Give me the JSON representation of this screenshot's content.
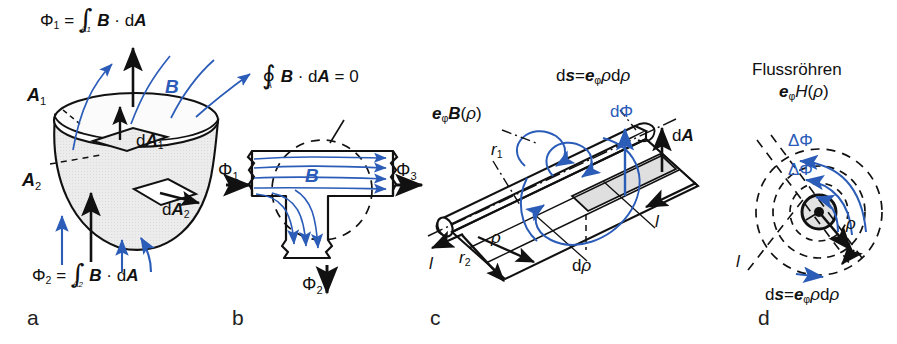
{
  "figure": {
    "background": "#ffffff",
    "ink_color": "#111111",
    "accent_blue": "#2b5cb8",
    "shade_gray": "#e8e8e8"
  },
  "panels": [
    {
      "id": "a",
      "letter": "a",
      "description": "Open bowl-shaped surface with surfaces A1 and A2 and flux arrows",
      "labels": {
        "flux1_formula": "Φ₁ = ∫ B · dA",
        "flux1_limit": "A₁",
        "flux2_formula": "Φ₂ = ∫ B · dA",
        "flux2_limit": "A₂",
        "surface_top": "A₁",
        "surface_bottom": "A₂",
        "element_top": "dA₁",
        "element_bottom": "dA₂",
        "field": "B"
      }
    },
    {
      "id": "b",
      "letter": "b",
      "description": "T-shaped magnetic circuit, closed surface integral equals zero",
      "labels": {
        "closed_integral": "∮ B · dA = 0",
        "closed_integral_limit": "A",
        "flux_in": "Φ₁",
        "flux_down": "Φ₂",
        "flux_out": "Φ₃",
        "field": "B"
      }
    },
    {
      "id": "c",
      "letter": "c",
      "description": "Cylindrical conductor with radial flux strip between r1 and r2",
      "labels": {
        "field_vector": "eφB(ρ)",
        "ds_vector": "ds=eφρdρ",
        "radius_inner": "r₁",
        "radius_outer": "r₂",
        "rho": "ρ",
        "drho": "dρ",
        "dphi": "dΦ",
        "dA": "dA",
        "length_left": "l",
        "length_right": "l"
      }
    },
    {
      "id": "d",
      "letter": "d",
      "description": "Cross section with concentric dashed flux tubes around a conductor",
      "labels": {
        "title": "Flussröhren",
        "field_vector": "eφH(ρ)",
        "delta_phi_outer": "ΔΦ",
        "delta_phi_inner": "ΔΦ",
        "rho": "ρ",
        "length": "l",
        "ds_vector": "ds=eφρdρ"
      }
    }
  ]
}
